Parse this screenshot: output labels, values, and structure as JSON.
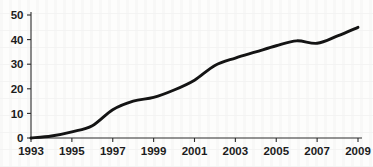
{
  "chart_data": {
    "type": "line",
    "title": "",
    "subtitle": "",
    "xlabel": "",
    "ylabel": "",
    "x": [
      1993,
      1994,
      1995,
      1996,
      1997,
      1998,
      1999,
      2000,
      2001,
      2002,
      2003,
      2004,
      2005,
      2006,
      2007,
      2008,
      2009
    ],
    "values": [
      0,
      0.8,
      2.5,
      5.0,
      11.5,
      15.0,
      16.5,
      19.5,
      23.5,
      29.5,
      32.5,
      35.0,
      37.5,
      39.5,
      38.5,
      41.5,
      45.0
    ],
    "series": [
      {
        "name": "",
        "values": [
          0,
          0.8,
          2.5,
          5.0,
          11.5,
          15.0,
          16.5,
          19.5,
          23.5,
          29.5,
          32.5,
          35.0,
          37.5,
          39.5,
          38.5,
          41.5,
          45.0
        ],
        "color": "#141414"
      }
    ],
    "xlim": [
      1993,
      2009
    ],
    "ylim": [
      0,
      50
    ],
    "x_tick_labels": [
      "1993",
      "1995",
      "1997",
      "1999",
      "2001",
      "2003",
      "2005",
      "2007",
      "2009"
    ],
    "x_tick_values": [
      1993,
      1995,
      1997,
      1999,
      2001,
      2003,
      2005,
      2007,
      2009
    ],
    "y_tick_labels": [
      "0",
      "10",
      "20",
      "30",
      "40",
      "50"
    ],
    "y_tick_values": [
      0,
      10,
      20,
      30,
      40,
      50
    ],
    "grid": false,
    "legend": null,
    "legend_position": "none",
    "annotations": [],
    "line_color": "#141414",
    "axis_color": "#2b2b2b",
    "background_color": "#fdfdfc"
  }
}
